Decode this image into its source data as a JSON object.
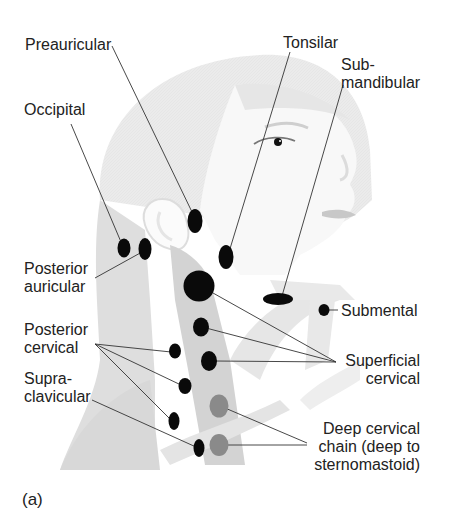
{
  "figure": {
    "panel_label": "(a)",
    "colors": {
      "background": "#ffffff",
      "head_silhouette": "#ececec",
      "face": "#f7f7f7",
      "neck_muscle": "#d6d6d6",
      "node_superficial": "#0a0a0a",
      "node_deep": "#8a8a8a",
      "leader_line": "#333333",
      "text": "#222222"
    }
  },
  "labels": {
    "preauricular": "Preauricular",
    "occipital": "Occipital",
    "tonsilar": "Tonsilar",
    "submandibular_1": "Sub-",
    "submandibular_2": "mandibular",
    "posterior_auricular_1": "Posterior",
    "posterior_auricular_2": "auricular",
    "submental": "Submental",
    "posterior_cervical_1": "Posterior",
    "posterior_cervical_2": "cervical",
    "superficial_cervical_1": "Superficial",
    "superficial_cervical_2": "cervical",
    "supraclavicular_1": "Supra-",
    "supraclavicular_2": "clavicular",
    "deep_cervical_1": "Deep cervical",
    "deep_cervical_2": "chain (deep to",
    "deep_cervical_3": "sternomastoid)"
  },
  "nodes": [
    {
      "name": "preauricular",
      "type": "superficial"
    },
    {
      "name": "occipital",
      "type": "superficial"
    },
    {
      "name": "posterior-auricular",
      "type": "superficial"
    },
    {
      "name": "tonsilar",
      "type": "superficial"
    },
    {
      "name": "submandibular",
      "type": "superficial"
    },
    {
      "name": "submental",
      "type": "superficial"
    },
    {
      "name": "superficial-cervical",
      "count": 3,
      "type": "superficial"
    },
    {
      "name": "posterior-cervical",
      "count": 3,
      "type": "superficial"
    },
    {
      "name": "supraclavicular",
      "type": "superficial"
    },
    {
      "name": "deep-cervical",
      "count": 2,
      "type": "deep"
    }
  ]
}
